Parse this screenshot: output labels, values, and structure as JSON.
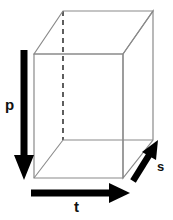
{
  "figure": {
    "title": "",
    "background_color": "#ffffff",
    "box": {
      "name": "rectangular-cuboid",
      "edge_color": "#8a8a8a",
      "hidden_edge_color": "#1a1a1a",
      "hidden_edge_style": "dashed",
      "front_face": {
        "top_left": [
          34,
          54
        ],
        "top_right": [
          123,
          54
        ],
        "bottom_right": [
          123,
          178
        ],
        "bottom_left": [
          34,
          178
        ]
      },
      "back_face": {
        "top_left": [
          63,
          11
        ],
        "top_right": [
          153,
          11
        ],
        "bottom_right": [
          153,
          140
        ],
        "bottom_left": [
          63,
          140
        ]
      }
    },
    "arrows": [
      {
        "id": "p",
        "label": "p",
        "direction": "down",
        "color": "#000000",
        "start": [
          24,
          50
        ],
        "end": [
          24,
          178
        ],
        "label_position": [
          5,
          97
        ]
      },
      {
        "id": "t",
        "label": "t",
        "direction": "right",
        "color": "#000000",
        "start": [
          31,
          193
        ],
        "end": [
          128,
          193
        ],
        "label_position": [
          74,
          199
        ]
      },
      {
        "id": "s",
        "label": "s",
        "direction": "up-right",
        "color": "#000000",
        "start": [
          133,
          181
        ],
        "end": [
          158,
          141
        ],
        "label_position": [
          157,
          160
        ]
      }
    ]
  }
}
